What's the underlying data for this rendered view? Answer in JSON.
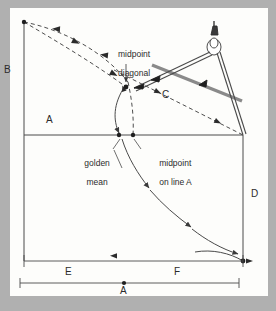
{
  "figure": {
    "background_color": "#b0b0b0",
    "panel_color": "#fdfdfb",
    "line_color": "#4a4a4a",
    "dark_line_color": "#1f1f1f",
    "ruler_color": "#8a8a8a",
    "dash_color": "#3a3a3a"
  },
  "labels": {
    "corner_b": "B",
    "line_a_top": "A",
    "diagonal_c": "C",
    "side_d": "D",
    "segment_e": "E",
    "segment_f": "F",
    "baseline_a": "A",
    "midpoint_diagonal": "midpoint\ndiagonal",
    "midpoint_diagonal_line1": "midpoint",
    "midpoint_diagonal_line2": "diagonal",
    "golden_mean_line1": "golden",
    "golden_mean_line2": "mean",
    "midpoint_on_line_a_line1": "midpoint",
    "midpoint_on_line_a_line2": "on line A"
  },
  "points": {
    "top_left": {
      "x": 24,
      "y": 22
    },
    "midpoint_diagonal": {
      "x": 126,
      "y": 81
    },
    "golden_mean": {
      "x": 119,
      "y": 135
    },
    "midpoint_on_line_a": {
      "x": 133,
      "y": 135
    },
    "bottom_right": {
      "x": 243,
      "y": 261
    },
    "baseline_center": {
      "x": 124,
      "y": 283
    }
  },
  "dimensions": {
    "segment_e_label": "E",
    "segment_f_label": "F",
    "baseline_label": "A"
  },
  "tools": {
    "compass": "compass-divider",
    "ruler": "straightedge-ruler"
  }
}
